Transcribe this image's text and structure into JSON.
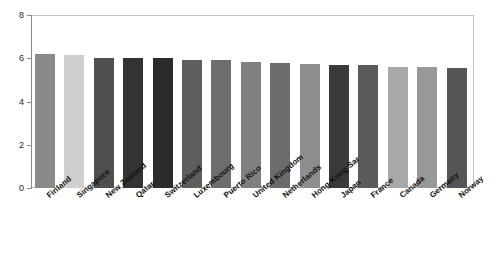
{
  "chart_data": {
    "type": "bar",
    "title": "",
    "subtitle": "",
    "xlabel": "",
    "ylabel": "",
    "ylim": [
      0,
      8
    ],
    "yticks": [
      0,
      2,
      4,
      6,
      8
    ],
    "grid": false,
    "legend": false,
    "categories": [
      "Finland",
      "Singapore",
      "New Zealand",
      "Qatar",
      "Switzerland",
      "Luxembourg",
      "Puerto Rico",
      "United Kingdom",
      "Netherlands",
      "Hong Kong Sar",
      "Japan",
      "France",
      "Canada",
      "Germany",
      "Norway"
    ],
    "values": [
      6.2,
      6.15,
      6.0,
      6.0,
      6.0,
      5.9,
      5.9,
      5.85,
      5.8,
      5.75,
      5.7,
      5.7,
      5.6,
      5.6,
      5.55
    ],
    "bar_colors": [
      "#8a8a8a",
      "#cfcfcf",
      "#4f4f4f",
      "#333333",
      "#2b2b2b",
      "#5e5e5e",
      "#6e6e6e",
      "#808080",
      "#6b6b6b",
      "#8e8e8e",
      "#3a3a3a",
      "#5a5a5a",
      "#a8a8a8",
      "#989898",
      "#555555"
    ],
    "axis_color": "#8a8a8a",
    "frame_color": "#bdbdbd",
    "background": "#ffffff"
  }
}
